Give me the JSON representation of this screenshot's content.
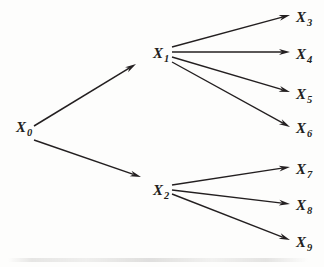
{
  "figure": {
    "type": "directed-tree-diagram",
    "background_color": "#fdfdfc",
    "stroke_color": "#231f20",
    "width": 324,
    "height": 267
  },
  "nodes": [
    {
      "id": "x0",
      "base": "X",
      "sub": "0",
      "x": 16,
      "y": 132,
      "sub_x": 27,
      "sub_y": 136
    },
    {
      "id": "x1",
      "base": "X",
      "sub": "1",
      "x": 153,
      "y": 58,
      "sub_x": 164,
      "sub_y": 62
    },
    {
      "id": "x2",
      "base": "X",
      "sub": "2",
      "x": 153,
      "y": 195,
      "sub_x": 164,
      "sub_y": 199
    },
    {
      "id": "x3",
      "base": "X",
      "sub": "3",
      "x": 296,
      "y": 22,
      "sub_x": 307,
      "sub_y": 26
    },
    {
      "id": "x4",
      "base": "X",
      "sub": "4",
      "x": 296,
      "y": 59,
      "sub_x": 307,
      "sub_y": 63
    },
    {
      "id": "x5",
      "base": "X",
      "sub": "5",
      "x": 296,
      "y": 99,
      "sub_x": 307,
      "sub_y": 103
    },
    {
      "id": "x6",
      "base": "X",
      "sub": "6",
      "x": 296,
      "y": 133,
      "sub_x": 307,
      "sub_y": 137
    },
    {
      "id": "x7",
      "base": "X",
      "sub": "7",
      "x": 296,
      "y": 174,
      "sub_x": 307,
      "sub_y": 178
    },
    {
      "id": "x8",
      "base": "X",
      "sub": "8",
      "x": 296,
      "y": 210,
      "sub_x": 307,
      "sub_y": 214
    },
    {
      "id": "x9",
      "base": "X",
      "sub": "9",
      "x": 296,
      "y": 247,
      "sub_x": 307,
      "sub_y": 251
    }
  ],
  "edges": [
    {
      "id": "x0-x1",
      "from": "x0",
      "to": "x1",
      "x1": 34,
      "y1": 126,
      "x2": 136,
      "y2": 64
    },
    {
      "id": "x0-x2",
      "from": "x0",
      "to": "x2",
      "x1": 34,
      "y1": 140,
      "x2": 141,
      "y2": 177
    },
    {
      "id": "x1-x3",
      "from": "x1",
      "to": "x3",
      "x1": 172,
      "y1": 47,
      "x2": 290,
      "y2": 15
    },
    {
      "id": "x1-x4",
      "from": "x1",
      "to": "x4",
      "x1": 172,
      "y1": 52,
      "x2": 290,
      "y2": 52
    },
    {
      "id": "x1-x5",
      "from": "x1",
      "to": "x5",
      "x1": 172,
      "y1": 57,
      "x2": 290,
      "y2": 92
    },
    {
      "id": "x1-x6",
      "from": "x1",
      "to": "x6",
      "x1": 172,
      "y1": 62,
      "x2": 290,
      "y2": 127
    },
    {
      "id": "x2-x7",
      "from": "x2",
      "to": "x7",
      "x1": 172,
      "y1": 185,
      "x2": 290,
      "y2": 167
    },
    {
      "id": "x2-x8",
      "from": "x2",
      "to": "x8",
      "x1": 172,
      "y1": 190,
      "x2": 290,
      "y2": 204
    },
    {
      "id": "x2-x9",
      "from": "x2",
      "to": "x9",
      "x1": 172,
      "y1": 194,
      "x2": 290,
      "y2": 240
    }
  ]
}
